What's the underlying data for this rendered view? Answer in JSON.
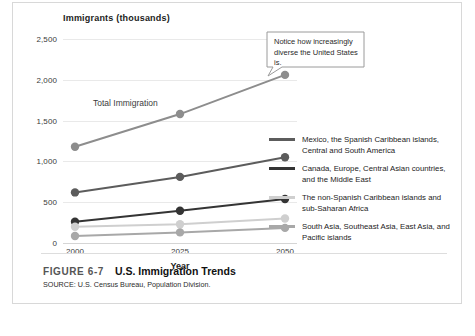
{
  "figure": {
    "number": "FIGURE 6-7",
    "title": "U.S. Immigration Trends",
    "source": "SOURCE: U.S. Census Bureau, Population Division."
  },
  "callout": {
    "text": "Notice how increasingly diverse the United States is."
  },
  "chart_data": {
    "type": "line",
    "title": "U.S. Immigration Trends",
    "xlabel": "Year",
    "ylabel": "Immigrants (thousands)",
    "x": [
      2000,
      2025,
      2050
    ],
    "xtick_labels": [
      "2000",
      "2025",
      "2050"
    ],
    "ylim": [
      0,
      2500
    ],
    "yticks": [
      0,
      500,
      1000,
      1500,
      2000,
      2500
    ],
    "ytick_labels": [
      "0",
      "500",
      "1,000",
      "1,500",
      "2,000",
      "2,500"
    ],
    "grid": true,
    "legend_position": "right",
    "annotations": [
      {
        "text": "Total Immigration",
        "x": 2012,
        "y": 1720
      }
    ],
    "series": [
      {
        "name": "Total Immigration",
        "values": [
          1180,
          1580,
          2060
        ],
        "color": "#8d8d8d",
        "in_legend": false
      },
      {
        "name": "Mexico, the Spanish Caribbean islands, Central and South America",
        "values": [
          620,
          810,
          1050
        ],
        "color": "#5c5c5c",
        "in_legend": true
      },
      {
        "name": "Canada, Europe, Central Asian countries, and the Middle East",
        "values": [
          260,
          395,
          540
        ],
        "color": "#343434",
        "in_legend": true
      },
      {
        "name": "The non-Spanish Caribbean islands and sub-Saharan Africa",
        "values": [
          200,
          230,
          300
        ],
        "color": "#cfcfcf",
        "in_legend": true
      },
      {
        "name": "South Asia, Southeast Asia, East Asia, and Pacific islands",
        "values": [
          85,
          130,
          185
        ],
        "color": "#a8a8a8",
        "in_legend": true
      }
    ]
  }
}
